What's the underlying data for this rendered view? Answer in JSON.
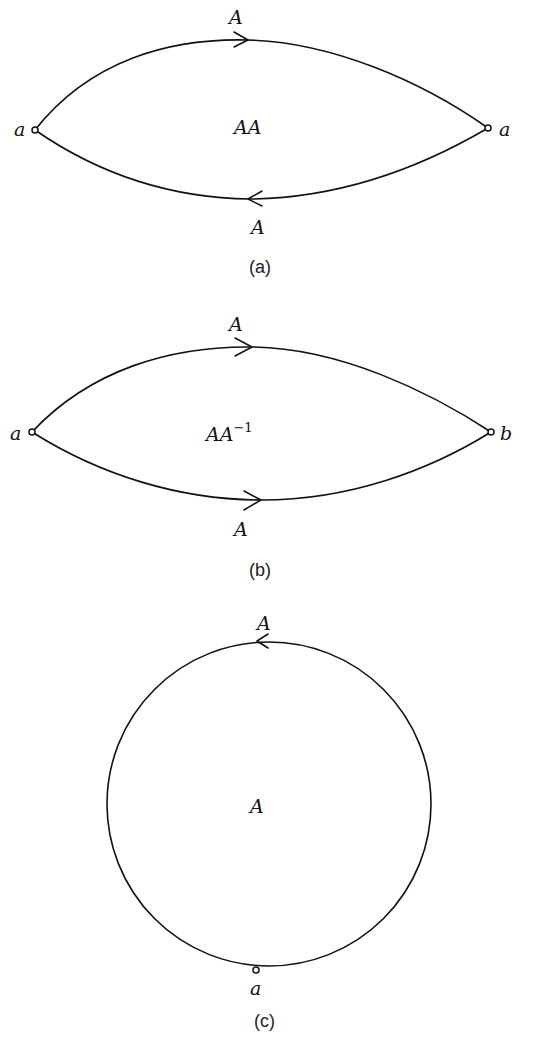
{
  "figures": [
    {
      "id": "a",
      "caption": "(a)",
      "region_label": "AA",
      "top_edge_label": "A",
      "bottom_edge_label": "A",
      "left_vertex_label": "a",
      "right_vertex_label": "a",
      "top_arrow_direction": "right",
      "bottom_arrow_direction": "left"
    },
    {
      "id": "b",
      "caption": "(b)",
      "region_label_base": "AA",
      "region_label_exponent": "−1",
      "top_edge_label": "A",
      "bottom_edge_label": "A",
      "left_vertex_label": "a",
      "right_vertex_label": "b",
      "top_arrow_direction": "right",
      "bottom_arrow_direction": "right"
    },
    {
      "id": "c",
      "caption": "(c)",
      "region_label": "A",
      "edge_label": "A",
      "vertex_label": "a",
      "arrow_direction": "left"
    }
  ]
}
